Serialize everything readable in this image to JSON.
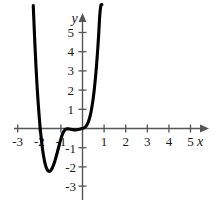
{
  "figure": {
    "background_color": "#ffffff",
    "curve_color": "#000000",
    "axis_color": "#55555a"
  },
  "axes": {
    "x_axis_label": "x",
    "y_axis_label": "y",
    "x_tick_labels": [
      "-3",
      "-2",
      "-1",
      "1",
      "2",
      "3",
      "4",
      "5"
    ],
    "y_tick_labels": [
      "5",
      "4",
      "3",
      "2",
      "1",
      "-1",
      "-2",
      "-3"
    ]
  },
  "chart_data": {
    "type": "line",
    "title": "",
    "xlabel": "x",
    "ylabel": "y",
    "xlim": [
      -3.6,
      5.8
    ],
    "ylim": [
      -3.8,
      6.2
    ],
    "grid": false,
    "legend": false,
    "x_ticks": [
      -3,
      -2,
      -1,
      1,
      2,
      3,
      4,
      5
    ],
    "y_ticks": [
      5,
      4,
      3,
      2,
      1,
      -1,
      -2,
      -3
    ],
    "series": [
      {
        "name": "polynomial",
        "x": [
          -2.28,
          -2.25,
          -2.2,
          -2.15,
          -2.1,
          -2.05,
          -2.0,
          -1.95,
          -1.9,
          -1.85,
          -1.8,
          -1.75,
          -1.7,
          -1.65,
          -1.6,
          -1.55,
          -1.5,
          -1.45,
          -1.4,
          -1.35,
          -1.3,
          -1.25,
          -1.2,
          -1.15,
          -1.1,
          -1.05,
          -1.0,
          -0.95,
          -0.9,
          -0.85,
          -0.8,
          -0.75,
          -0.7,
          -0.65,
          -0.6,
          -0.55,
          -0.5,
          -0.45,
          -0.4,
          -0.35,
          -0.3,
          -0.25,
          -0.2,
          -0.15,
          -0.1,
          -0.05,
          0.0,
          0.05,
          0.1,
          0.15,
          0.2,
          0.25,
          0.3,
          0.35,
          0.4,
          0.45,
          0.5,
          0.55,
          0.6,
          0.65,
          0.7,
          0.75,
          0.8,
          0.85,
          0.9
        ],
        "y": [
          6.4,
          5.6,
          4.3,
          3.15,
          2.15,
          1.3,
          0.55,
          -0.08,
          -0.62,
          -1.08,
          -1.45,
          -1.74,
          -1.96,
          -2.11,
          -2.2,
          -2.23,
          -2.22,
          -2.16,
          -2.06,
          -1.93,
          -1.77,
          -1.58,
          -1.38,
          -1.17,
          -0.96,
          -0.74,
          -0.54,
          -0.36,
          -0.22,
          -0.12,
          -0.06,
          -0.03,
          -0.02,
          -0.02,
          -0.03,
          -0.04,
          -0.05,
          -0.06,
          -0.07,
          -0.07,
          -0.07,
          -0.06,
          -0.05,
          -0.04,
          -0.02,
          -0.01,
          0.0,
          0.02,
          0.05,
          0.1,
          0.18,
          0.29,
          0.44,
          0.64,
          0.9,
          1.22,
          1.61,
          2.08,
          2.64,
          3.29,
          4.05,
          4.92,
          5.9,
          6.4,
          6.45
        ]
      }
    ],
    "features": {
      "x_intercepts": [
        -2.0,
        -1.0,
        0.0
      ],
      "local_minimum": {
        "x": -1.55,
        "y": -2.23
      },
      "local_maximum": {
        "x": -0.72,
        "y": -0.02
      }
    }
  }
}
